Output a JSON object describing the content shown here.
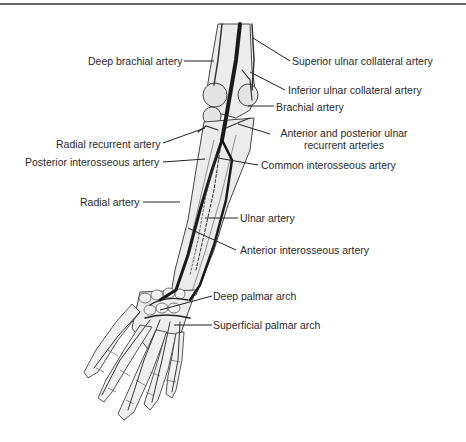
{
  "figure": {
    "labels_left": [
      {
        "id": "deep_brachial",
        "text": "Deep brachial artery"
      },
      {
        "id": "radial_recurrent",
        "text": "Radial recurrent artery"
      },
      {
        "id": "posterior_interosseous",
        "text": "Posterior interosseous artery"
      },
      {
        "id": "radial",
        "text": "Radial artery"
      }
    ],
    "labels_right": [
      {
        "id": "superior_ulnar_collateral",
        "text": "Superior ulnar collateral artery"
      },
      {
        "id": "inferior_ulnar_collateral",
        "text": "Inferior ulnar collateral artery"
      },
      {
        "id": "brachial",
        "text": "Brachial artery"
      },
      {
        "id": "ulnar_recurrent",
        "text": "Anterior and posterior ulnar",
        "text2": "recurrent arteries"
      },
      {
        "id": "common_interosseous",
        "text": "Common interosseous artery"
      },
      {
        "id": "ulnar",
        "text": "Ulnar artery"
      },
      {
        "id": "anterior_interosseous",
        "text": "Anterior interosseous artery"
      },
      {
        "id": "deep_palmar_arch",
        "text": "Deep palmar arch"
      },
      {
        "id": "superficial_palmar_arch",
        "text": "Superficial palmar arch"
      }
    ]
  }
}
